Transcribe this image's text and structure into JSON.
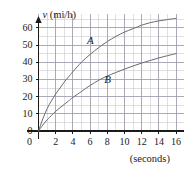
{
  "chart_data": {
    "type": "line",
    "title": "",
    "subtitle": "",
    "xlabel": "t",
    "xlabel_unit": "(seconds)",
    "ylabel": "v (mi/h)",
    "ylabel_symbol": "v",
    "ylabel_unit": "(mi/h)",
    "xlim": [
      0,
      17
    ],
    "ylim": [
      0,
      68
    ],
    "grid": true,
    "grid_minor_x_step": 1,
    "grid_minor_y_step": 5,
    "grid_major_x_step": 2,
    "grid_major_y_step": 10,
    "legend_position": "inline-annotations",
    "x_ticks": [
      0,
      2,
      4,
      6,
      8,
      10,
      12,
      14,
      16
    ],
    "x_tick_labels": [
      "0",
      "2",
      "4",
      "6",
      "8",
      "10",
      "12",
      "14",
      "16"
    ],
    "y_ticks": [
      0,
      10,
      20,
      30,
      40,
      50,
      60
    ],
    "y_tick_labels": [
      "0",
      "10",
      "20",
      "30",
      "40",
      "50",
      "60"
    ],
    "series": [
      {
        "name": "A",
        "label": "A",
        "color": "#6b6b6b",
        "annotation_at": {
          "x": 6.0,
          "y": 52.5
        },
        "x": [
          0,
          0.5,
          1,
          1.5,
          2,
          2.5,
          3,
          3.5,
          4,
          5,
          6,
          7,
          8,
          9,
          10,
          11,
          12,
          13,
          14,
          15,
          16
        ],
        "values": [
          0,
          7,
          13,
          17.5,
          21.5,
          25,
          28.5,
          31.5,
          34.5,
          40,
          44.5,
          48.5,
          52,
          55,
          57.5,
          59.5,
          61.5,
          63,
          64,
          64.8,
          65.5
        ]
      },
      {
        "name": "B",
        "label": "B",
        "color": "#6b6b6b",
        "annotation_at": {
          "x": 8.0,
          "y": 29.5
        },
        "x": [
          0,
          0.5,
          1,
          1.5,
          2,
          2.5,
          3,
          3.5,
          4,
          5,
          6,
          7,
          8,
          9,
          10,
          11,
          12,
          13,
          14,
          15,
          16
        ],
        "values": [
          0,
          3.5,
          6.5,
          9,
          11.5,
          13.5,
          15.5,
          17.5,
          19.5,
          23,
          26.5,
          29.5,
          32,
          34,
          36,
          37.8,
          39.5,
          41,
          42.5,
          43.8,
          45
        ]
      }
    ],
    "axis_color": "#1a1a1a",
    "grid_minor_color": "#c8c8d2",
    "grid_major_color": "#9a9aa8",
    "background_color": "#ffffff"
  }
}
